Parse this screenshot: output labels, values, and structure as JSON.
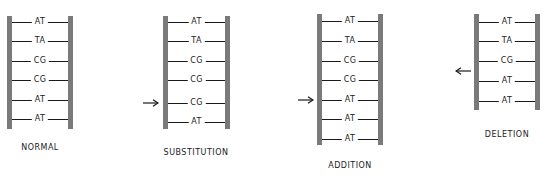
{
  "colors": {
    "rail": "#7a7a7a",
    "rung": "#1a1a1a",
    "text": "#222222"
  },
  "panels": [
    {
      "id": "normal",
      "caption": "NORMAL",
      "pairs": [
        "AT",
        "TA",
        "CG",
        "CG",
        "AT",
        "AT"
      ],
      "arrow": null
    },
    {
      "id": "substitution",
      "caption": "SUBSTITUTION",
      "pairs": [
        "AT",
        "TA",
        "CG",
        "CG",
        "CG",
        "AT"
      ],
      "arrow": {
        "direction": "right",
        "points_to_row": 5
      }
    },
    {
      "id": "addition",
      "caption": "ADDITION",
      "pairs": [
        "AT",
        "TA",
        "CG",
        "CG",
        "AT",
        "AT",
        "AT"
      ],
      "arrow": {
        "direction": "right",
        "points_to_row": 5
      }
    },
    {
      "id": "deletion",
      "caption": "DELETION",
      "pairs": [
        "AT",
        "TA",
        "CG",
        "AT",
        "AT"
      ],
      "arrow": {
        "direction": "left",
        "between_rows": [
          3,
          4
        ]
      }
    }
  ]
}
